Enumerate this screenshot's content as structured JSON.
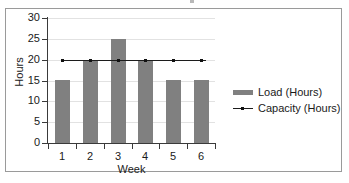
{
  "figure": {
    "frame_border_color": "#9a9a9a",
    "background": "#ffffff"
  },
  "legend": {
    "position": "right",
    "items": [
      {
        "label": "Load (Hours)",
        "marker": "bar-swatch",
        "color": "#808080"
      },
      {
        "label": "Capacity (Hours)",
        "marker": "line-swatch",
        "color": "#1c1c1c"
      }
    ]
  },
  "chart_data": {
    "type": "bar",
    "title": "",
    "subtitle": "",
    "xlabel": "Week",
    "ylabel": "Hours",
    "categories": [
      "1",
      "2",
      "3",
      "4",
      "5",
      "6"
    ],
    "ytick_labels": [
      "0",
      "5",
      "10",
      "15",
      "20",
      "25",
      "30"
    ],
    "ytick_values": [
      0,
      5,
      10,
      15,
      20,
      25,
      30
    ],
    "ylim": [
      0,
      30
    ],
    "grid": "horizontal",
    "grid_color": "#e2e2e2",
    "legend_position": "right",
    "series": [
      {
        "name": "Load (Hours)",
        "type": "bar",
        "color": "#808080",
        "values": [
          15,
          20,
          25,
          20,
          15,
          15
        ]
      },
      {
        "name": "Capacity (Hours)",
        "type": "line",
        "color": "#1c1c1c",
        "marker": "square",
        "values": [
          20,
          20,
          20,
          20,
          20,
          20
        ]
      }
    ],
    "annotations": []
  }
}
